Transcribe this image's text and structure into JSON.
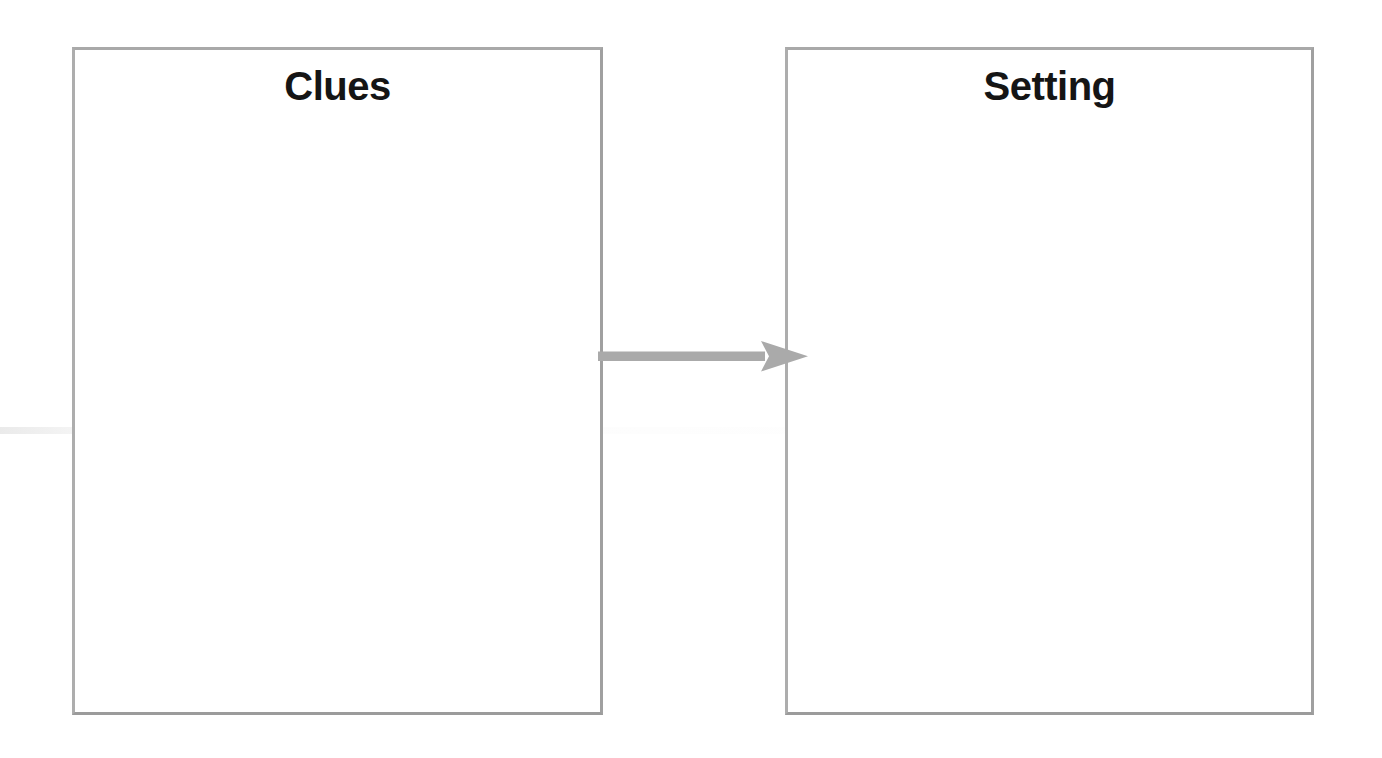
{
  "page": {
    "type": "graphic-organizer",
    "background_color": "#ffffff",
    "width": 1382,
    "height": 758
  },
  "boxes": [
    {
      "id": "clues",
      "title": "Clues",
      "body_text": "",
      "border_color": "#a3a3a3",
      "fill_color": "#ffffff"
    },
    {
      "id": "setting",
      "title": "Setting",
      "body_text": "",
      "border_color": "#a3a3a3",
      "fill_color": "#ffffff"
    }
  ],
  "connector": {
    "name": "arrow-right",
    "direction": "right",
    "from": "clues",
    "to": "setting",
    "color": "#aaaaaa"
  }
}
